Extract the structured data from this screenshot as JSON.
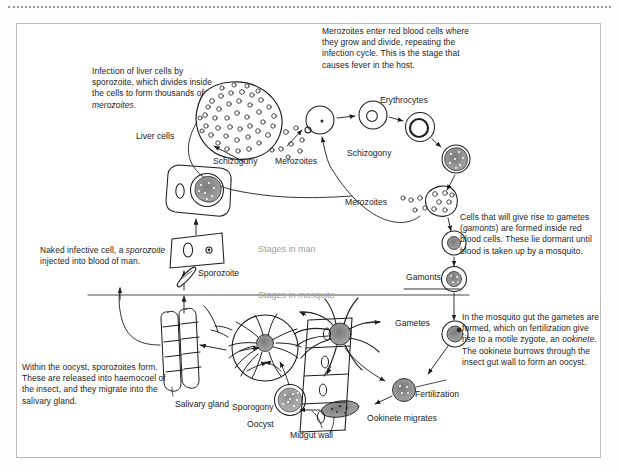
{
  "figure": {
    "frame_color": "#b9b9b9",
    "ink_color": "#1c1c1c",
    "zone_label_color": "#9d9d9d",
    "background": "#ffffff"
  },
  "captions": {
    "liver_infection": {
      "line1": "Infection of liver cells",
      "line2": "by sporozoite, which",
      "line3": "divides inside the cells",
      "line4": "to form thousands of",
      "line5_italic": "merozoites",
      "line5_tail": "."
    },
    "merozoites_rbc": {
      "text": "Merozoites enter red blood cells where they grow and divide, repeating the infection cycle. This is the stage that causes fever in the host."
    },
    "naked_cell": {
      "line1": "Naked infective cell,",
      "line2_a": "a ",
      "line2_italic": "sporozoite",
      "line2_b": " injected",
      "line3": "into blood of man."
    },
    "gamonts": {
      "a": "Cells that will give rise",
      "b_pre": "to gametes (",
      "b_italic": "gamonts",
      "b_post": ") are",
      "c": "formed inside red blood",
      "d": "cells. These lie dormant",
      "e": "until blood is taken up",
      "f": "by a mosquito."
    },
    "mosquito_gut": {
      "a": "In the mosquito gut the",
      "b": "gametes are formed, which",
      "c": "on fertilization give rise",
      "d": "to a motile zygote, an",
      "e_italic": "ookinete",
      "e_post": ". The ookinete",
      "f": "burrows through the insect",
      "g": "gut wall to form an oocyst."
    },
    "oocyst_sporozoites": {
      "a": "Within the oocyst, sporozoites",
      "b": "form. These are released into",
      "c": "haemocoel of the insect, and",
      "d": "they migrate into the salivary",
      "e": "gland."
    }
  },
  "labels": {
    "liver_cells": "Liver cells",
    "schizogony_liver": "Schizogony",
    "merozoites_liver": "Merozoites",
    "erythrocytes": "Erythrocytes",
    "schizogony_blood": "Schizogony",
    "merozoites_blood": "Merozoites",
    "gamonts": "Gamonts",
    "gametes": "Gametes",
    "fertilization": "Fertilization",
    "ookinete_migrates": "Ookinete migrates",
    "midgut_wall": "Midgut wall",
    "oocyst": "Oocyst",
    "sporogony": "Sporogony",
    "salivary_gland": "Salivary gland",
    "sporozoite": "Sporozoite"
  },
  "zones": {
    "man": "Stages in man",
    "mosquito": "Stages in mosquito"
  }
}
